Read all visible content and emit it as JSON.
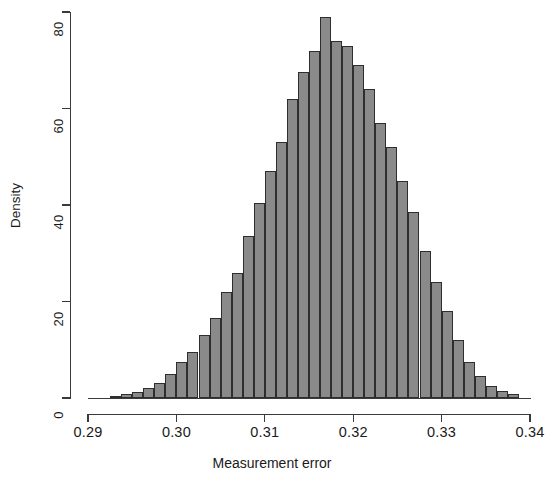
{
  "chart_data": {
    "type": "bar",
    "subtype": "histogram",
    "title": "",
    "xlabel": "Measurement error",
    "ylabel": "Density",
    "xlim": [
      0.29,
      0.34
    ],
    "ylim": [
      0,
      80
    ],
    "xticks": [
      0.29,
      0.3,
      0.31,
      0.32,
      0.33,
      0.34
    ],
    "xtick_labels": [
      "0.29",
      "0.30",
      "0.31",
      "0.32",
      "0.33",
      "0.34"
    ],
    "yticks": [
      0,
      20,
      40,
      60,
      80
    ],
    "ytick_labels": [
      "0",
      "20",
      "40",
      "60",
      "80"
    ],
    "grid": false,
    "legend": false,
    "bar_fill_color": "#8a8a8a",
    "bar_edge_color": "#2e2e2e",
    "bin_width": 0.00125,
    "bin_starts": [
      0.2925,
      0.29375,
      0.295,
      0.29625,
      0.2975,
      0.29875,
      0.3,
      0.30125,
      0.3025,
      0.30375,
      0.305,
      0.30625,
      0.3075,
      0.30875,
      0.31,
      0.31125,
      0.3125,
      0.31375,
      0.315,
      0.31625,
      0.3175,
      0.31875,
      0.32,
      0.32125,
      0.3225,
      0.32375,
      0.325,
      0.32625,
      0.3275,
      0.32875,
      0.33,
      0.33125,
      0.3325,
      0.33375,
      0.335,
      0.33625,
      0.3375
    ],
    "densities": [
      0.4,
      0.8,
      1.2,
      2.0,
      3.2,
      5.0,
      7.5,
      9.5,
      13.0,
      16.5,
      22.0,
      26.0,
      33.5,
      40.5,
      47.0,
      53.0,
      62.0,
      67.5,
      72.0,
      79.0,
      74.0,
      73.0,
      69.0,
      64.0,
      57.0,
      52.0,
      45.0,
      38.5,
      30.5,
      24.0,
      18.0,
      12.0,
      7.5,
      4.5,
      2.5,
      1.5,
      0.8
    ]
  }
}
